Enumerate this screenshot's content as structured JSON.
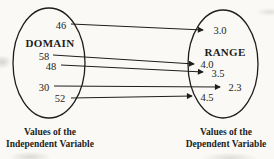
{
  "diagram": {
    "type": "function-mapping-diagram",
    "domain": {
      "title": "DOMAIN",
      "values": [
        "46",
        "58",
        "48",
        "30",
        "52"
      ],
      "caption": {
        "line1": "Values of the",
        "line2": "Independent Variable"
      }
    },
    "range": {
      "title": "RANGE",
      "values": [
        "3.0",
        "4.0",
        "3.5",
        "2.3",
        "4.5"
      ],
      "caption": {
        "line1": "Values of the",
        "line2": "Dependent Variable"
      }
    },
    "mappings": [
      {
        "from": "46",
        "to": "3.0"
      },
      {
        "from": "58",
        "to": "4.0"
      },
      {
        "from": "48",
        "to": "3.5"
      },
      {
        "from": "30",
        "to": "2.3"
      },
      {
        "from": "52",
        "to": "4.5"
      }
    ],
    "colors": {
      "ink": "#1e1e1e",
      "paper": "#faf9f5"
    }
  }
}
